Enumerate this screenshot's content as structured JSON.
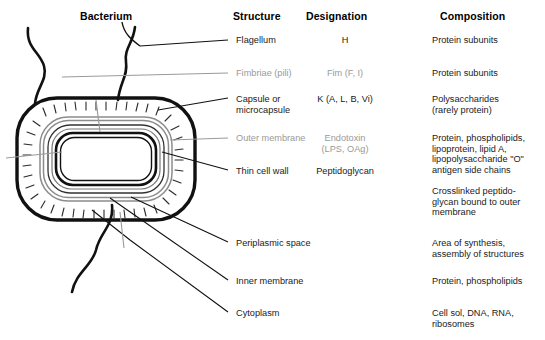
{
  "figure": {
    "type": "labeled-diagram"
  },
  "headers": {
    "bacterium": "Bacterium",
    "structure": "Structure",
    "designation": "Designation",
    "composition": "Composition"
  },
  "rows": [
    {
      "structure": "Flagellum",
      "designation": "H",
      "composition": "Protein subunits",
      "muted": false
    },
    {
      "structure": "Fimbriae (pili)",
      "designation": "Fim (F, I)",
      "composition": "Protein subunits",
      "muted": true
    },
    {
      "structure": "Capsule or\nmicrocapsule",
      "designation": "K (A, L, B, Vi)",
      "composition": "Polysaccharides\n(rarely protein)",
      "muted": false
    },
    {
      "structure": "Outer membrane",
      "designation": "Endotoxin\n(LPS, OAg)",
      "composition": "Protein, phospholipids,\nlipoprotein, lipid A,\nlipopolysaccharide \"O\"\nantigen side chains",
      "muted": true
    },
    {
      "structure": "Thin cell wall",
      "designation": "Peptidoglycan",
      "composition": "Crosslinked peptido-\nglycan bound to outer\nmembrane",
      "muted": false
    },
    {
      "structure": "Periplasmic space",
      "designation": "",
      "composition": "Area of synthesis,\nassembly of structures",
      "muted": false
    },
    {
      "structure": "Inner membrane",
      "designation": "",
      "composition": "Protein, phospholipids",
      "muted": false
    },
    {
      "structure": "Cytoplasm",
      "designation": "",
      "composition": "Cell sol, DNA, RNA,\nribosomes",
      "muted": false
    }
  ],
  "colors": {
    "ink": "#111111",
    "muted": "#9a9a9a",
    "envelope_dark": "#1a1a1a",
    "envelope_light": "#8c8c8c",
    "background": "#ffffff"
  }
}
